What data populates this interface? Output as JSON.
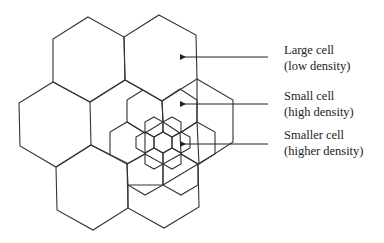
{
  "diagram": {
    "title": "",
    "labels": [
      {
        "line1": "Large cell",
        "line2": "(low density)"
      },
      {
        "line1": "Small cell",
        "line2": "(high density)"
      },
      {
        "line1": "Smaller cell",
        "line2": "(higher density)"
      }
    ],
    "colors": {
      "stroke": "#333333",
      "background": "#ffffff"
    }
  }
}
